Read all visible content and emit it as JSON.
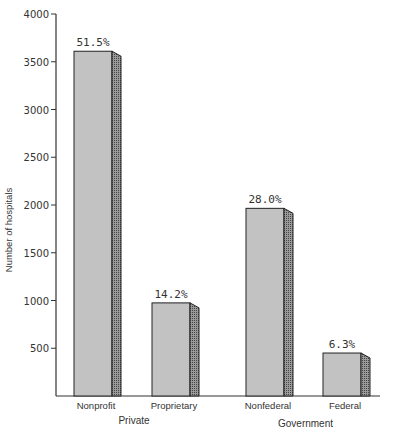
{
  "chart_data": {
    "type": "bar",
    "title": "",
    "xlabel": "",
    "ylabel": "Number of hospitals",
    "ylim": [
      0,
      4000
    ],
    "yticks": [
      500,
      1000,
      1500,
      2000,
      2500,
      3000,
      3500,
      4000
    ],
    "categories": [
      "Nonprofit",
      "Proprietary",
      "Nonfederal",
      "Federal"
    ],
    "groups": [
      {
        "label": "Private",
        "categories": [
          "Nonprofit",
          "Proprietary"
        ]
      },
      {
        "label": "Government",
        "categories": [
          "Nonfederal",
          "Federal"
        ]
      }
    ],
    "values": [
      3610,
      975,
      1965,
      450
    ],
    "data_labels": [
      "51.5%",
      "14.2%",
      "28.0%",
      "6.3%"
    ],
    "grid": false,
    "legend": "none",
    "colors": {
      "bar_face": "#c2c2c2",
      "bar_side": "#8a8a8a",
      "outline": "#222222"
    }
  }
}
